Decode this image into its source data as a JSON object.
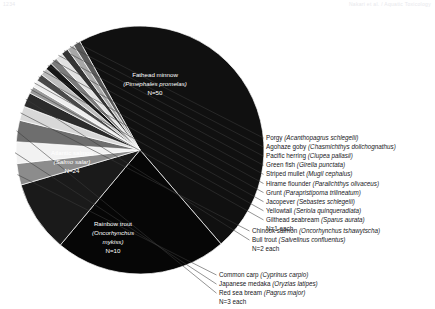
{
  "running_head": {
    "left": "1234",
    "right": "Nakari et al. / Aquatic Toxicology"
  },
  "chart_data": {
    "type": "pie",
    "title": "",
    "unit": "N (number of studies)",
    "total": 159,
    "legend_position": "right-callouts",
    "slices": [
      {
        "label": "Fathead minnow",
        "scientific": "Pimephales promelas",
        "n": 50,
        "color": "#101010",
        "label_placement": "inside"
      },
      {
        "label": "Atlantic salmon",
        "scientific": "Salmo salar",
        "n": 24,
        "color": "#060606",
        "label_placement": "inside"
      },
      {
        "label": "Rainbow trout",
        "scientific": "Oncorhynchus mykiss",
        "n": 10,
        "color": "#1a1a1a",
        "label_placement": "inside"
      },
      {
        "label": "Common carp",
        "scientific": "Cyprinus carpio",
        "n": 3,
        "color": "#8c8c8c",
        "label_placement": "callout-bottom"
      },
      {
        "label": "Japanese medaka",
        "scientific": "Oryzias latipes",
        "n": 3,
        "color": "#f2f2f2",
        "label_placement": "callout-bottom"
      },
      {
        "label": "Red sea bream",
        "scientific": "Pagrus major",
        "n": 3,
        "color": "#6e6e6e",
        "label_placement": "callout-bottom"
      },
      {
        "label": "Chinook salmon",
        "scientific": "Oncorhynchus tshawytscha",
        "n": 2,
        "color": "#d8d8d8",
        "label_placement": "callout-mid"
      },
      {
        "label": "Bull trout",
        "scientific": "Salvelinus confluentus",
        "n": 2,
        "color": "#2b2b2b",
        "label_placement": "callout-mid"
      },
      {
        "label": "Gilthead seabream",
        "scientific": "Sparus aurata",
        "n": 1,
        "color": "#9a9a9a",
        "label_placement": "callout-top"
      },
      {
        "label": "Yellowtail",
        "scientific": "Seriola quinqueradiata",
        "n": 1,
        "color": "#efefef",
        "label_placement": "callout-top"
      },
      {
        "label": "Jacopever",
        "scientific": "Sebastes schlegelii",
        "n": 1,
        "color": "#4a4a4a",
        "label_placement": "callout-top"
      },
      {
        "label": "Grunt",
        "scientific": "Parapristipoma trilineatum",
        "n": 1,
        "color": "#bdbdbd",
        "label_placement": "callout-top"
      },
      {
        "label": "Hirame flounder",
        "scientific": "Paralichthys olivaceus",
        "n": 1,
        "color": "#161616",
        "label_placement": "callout-top"
      },
      {
        "label": "Striped mullet",
        "scientific": "Mugil cephalus",
        "n": 1,
        "color": "#7c7c7c",
        "label_placement": "callout-top"
      },
      {
        "label": "Green fish",
        "scientific": "Girella punctata",
        "n": 1,
        "color": "#e2e2e2",
        "label_placement": "callout-top"
      },
      {
        "label": "Pacific herring",
        "scientific": "Clupea pallasii",
        "n": 1,
        "color": "#343434",
        "label_placement": "callout-top"
      },
      {
        "label": "Agohaze goby",
        "scientific": "Chasmichthys dolichognathus",
        "n": 1,
        "color": "#a8a8a8",
        "label_placement": "callout-top"
      },
      {
        "label": "Porgy",
        "scientific": "Acanthopagrus schlegelii",
        "n": 1,
        "color": "#5a5a5a",
        "label_placement": "callout-top"
      }
    ],
    "inside_labels": [
      {
        "name": "fathead-minnow",
        "line1": "Fathead minnow",
        "line2": "(Pimephales promelas)",
        "line3": "N=50"
      },
      {
        "name": "atlantic-salmon",
        "line1": "Atlantic salmon",
        "line2": "(Salmo salar)",
        "line3": "N=24"
      },
      {
        "name": "rainbow-trout",
        "line1": "Rainbow trout",
        "line2": "(Oncorhynchus",
        "line2b": "mykiss)",
        "line3": "N=10"
      }
    ],
    "callout_groups": [
      {
        "name": "n1-group",
        "entries": [
          {
            "common": "Porgy",
            "sci": "(Acanthopagrus schlegelii)"
          },
          {
            "common": "Agohaze goby",
            "sci": "(Chasmichthys dolichognathus)"
          },
          {
            "common": "Pacific herring",
            "sci": "(Clupea pallasii)"
          },
          {
            "common": "Green fish",
            "sci": "(Girella punctata)"
          },
          {
            "common": "Striped mullet",
            "sci": "(Mugil cephalus)"
          },
          {
            "common": "Hirame flounder",
            "sci": "(Paralichthys olivaceus)"
          },
          {
            "common": "Grunt",
            "sci": "(Parapristipoma trilineatum)"
          },
          {
            "common": "Jacopever",
            "sci": "(Sebastes schlegelii)"
          },
          {
            "common": "Yellowtail",
            "sci": "(Seriola quinqueradiata)"
          },
          {
            "common": "Gilthead seabream",
            "sci": "(Sparus aurata)"
          }
        ],
        "footer": "N=1 each"
      },
      {
        "name": "n2-group",
        "entries": [
          {
            "common": "Chinook salmon",
            "sci": "(Oncorhynchus tshawytscha)"
          },
          {
            "common": "Bull trout",
            "sci": "(Salvelinus confluentus)"
          }
        ],
        "footer": "N=2 each"
      },
      {
        "name": "n3-group",
        "entries": [
          {
            "common": "Common carp",
            "sci": "(Cyprinus carpio)"
          },
          {
            "common": "Japanese medaka",
            "sci": "(Oryzias latipes)"
          },
          {
            "common": "Red sea bream",
            "sci": "(Pagrus major)"
          }
        ],
        "footer": "N=3 each"
      }
    ]
  }
}
